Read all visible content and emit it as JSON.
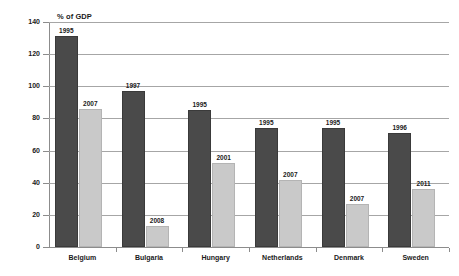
{
  "chart_data": {
    "type": "bar",
    "title": "",
    "ylabel": "% of GDP",
    "xlabel": "",
    "ylim": [
      0,
      140
    ],
    "yticks": [
      0,
      20,
      40,
      60,
      80,
      100,
      120,
      140
    ],
    "grid": true,
    "legend": "none",
    "categories": [
      "Belgium",
      "Bulgaria",
      "Hungary",
      "Netherlands",
      "Denmark",
      "Sweden"
    ],
    "series": [
      {
        "name": "Peak year",
        "color": "#4a4a4a",
        "values": [
          131,
          97,
          85,
          74,
          74,
          71
        ],
        "point_labels": [
          "1995",
          "1997",
          "1995",
          "1995",
          "1995",
          "1996"
        ]
      },
      {
        "name": "Later year",
        "color": "#c9c9c9",
        "values": [
          86,
          13,
          52,
          42,
          27,
          36
        ],
        "point_labels": [
          "2007",
          "2008",
          "2001",
          "2007",
          "2007",
          "2011"
        ]
      }
    ]
  },
  "axis": {
    "y_title": "% of GDP",
    "tick_labels": [
      "140",
      "120",
      "100",
      "80",
      "60",
      "40",
      "20",
      "0"
    ]
  }
}
